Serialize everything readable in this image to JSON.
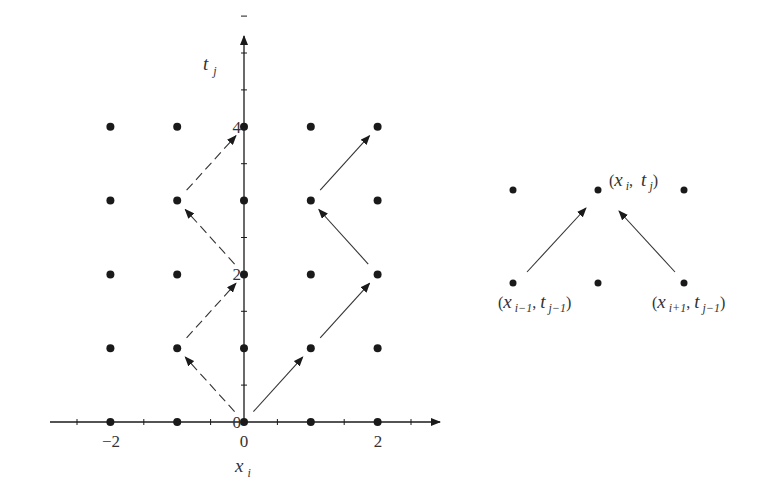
{
  "figure": {
    "left": {
      "x_axis_label": "x",
      "x_axis_label_sub": "i",
      "y_axis_label": "t",
      "y_axis_label_sub": "j",
      "x_tick_labels": [
        {
          "value": -2,
          "text": "−2"
        },
        {
          "value": 0,
          "text": "0"
        },
        {
          "value": 2,
          "text": "2"
        }
      ],
      "y_tick_labels": [
        {
          "value": 0,
          "text": "0"
        },
        {
          "value": 2,
          "text": "2"
        },
        {
          "value": 4,
          "text": "4"
        }
      ],
      "x_range": [
        -3,
        3
      ],
      "y_range": [
        0,
        6
      ],
      "grid_x": [
        -2,
        -1,
        0,
        1,
        2
      ],
      "grid_t": [
        0,
        1,
        2,
        3,
        4
      ],
      "dashed_path": [
        [
          0,
          0
        ],
        [
          -1,
          1
        ],
        [
          0,
          2
        ],
        [
          -1,
          3
        ],
        [
          0,
          4
        ]
      ],
      "solid_path": [
        [
          0,
          0
        ],
        [
          1,
          1
        ],
        [
          2,
          2
        ],
        [
          1,
          3
        ],
        [
          2,
          4
        ]
      ]
    },
    "right": {
      "top_label": {
        "x": "x",
        "x_sub": "i",
        "t": "t",
        "t_sub": "j"
      },
      "bottom_left_label": {
        "x": "x",
        "x_sub": "i−1",
        "t": "t",
        "t_sub": "j−1"
      },
      "bottom_right_label": {
        "x": "x",
        "x_sub": "i+1",
        "t": "t",
        "t_sub": "j−1"
      }
    }
  },
  "colors": {
    "ink": "#1a1a1a",
    "label": "#333333",
    "background": "#ffffff"
  }
}
